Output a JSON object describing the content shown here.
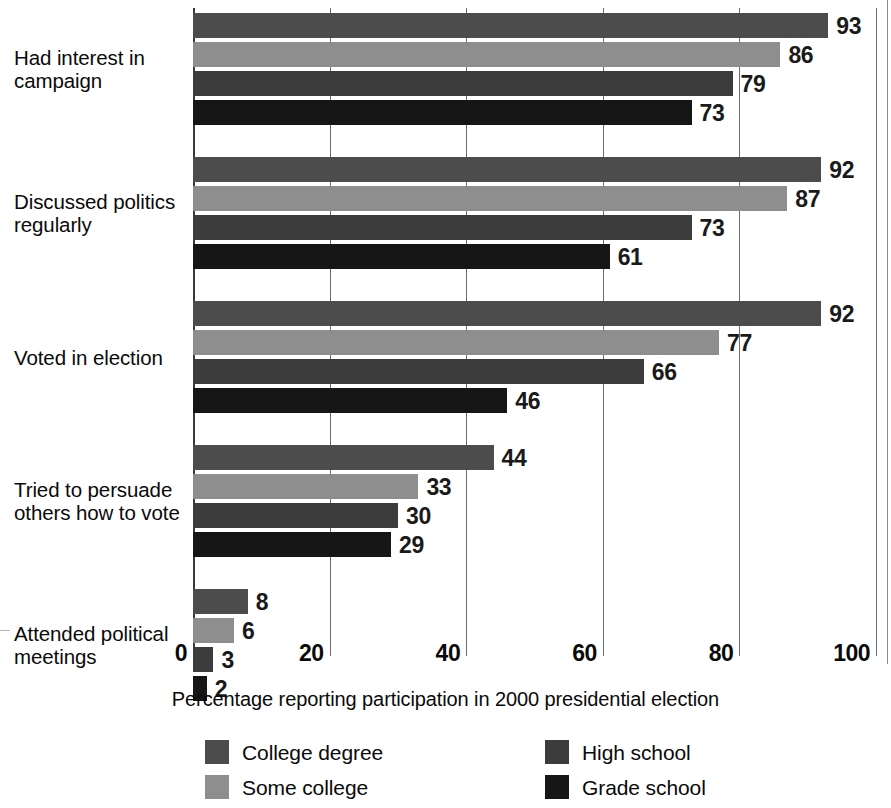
{
  "chart_data": {
    "type": "bar",
    "orientation": "horizontal",
    "title": "",
    "subtitle": "",
    "xlabel": "Percentage reporting participation in 2000 presidential election",
    "ylabel": "",
    "xlim": [
      0,
      100
    ],
    "xticks": [
      0,
      20,
      40,
      60,
      80,
      100
    ],
    "xtick_labels": [
      "0",
      "20",
      "40",
      "60",
      "80",
      "100"
    ],
    "grid": true,
    "grid_axis": "x",
    "legend_position": "bottom",
    "categories": [
      "Had interest in campaign",
      "Discussed politics regularly",
      "Voted in election",
      "Tried to persuade others how to vote",
      "Attended political meetings"
    ],
    "category_lines": [
      [
        "Had interest in",
        "campaign"
      ],
      [
        "Discussed politics",
        "regularly"
      ],
      [
        "Voted in election"
      ],
      [
        "Tried to persuade",
        "others how to vote"
      ],
      [
        "Attended political",
        "meetings"
      ]
    ],
    "series": [
      {
        "name": "College degree",
        "color": "#4c4c4c",
        "values": [
          93,
          92,
          92,
          44,
          8
        ]
      },
      {
        "name": "Some college",
        "color": "#8e8e8e",
        "values": [
          86,
          87,
          77,
          33,
          6
        ]
      },
      {
        "name": "High school",
        "color": "#3c3c3c",
        "values": [
          79,
          73,
          66,
          30,
          3
        ]
      },
      {
        "name": "Grade school",
        "color": "#161616",
        "values": [
          73,
          61,
          46,
          29,
          2
        ]
      }
    ]
  },
  "legend": {
    "items": [
      {
        "label": "College degree",
        "color": "#4c4c4c"
      },
      {
        "label": "Some college",
        "color": "#8e8e8e"
      },
      {
        "label": "High school",
        "color": "#3c3c3c"
      },
      {
        "label": "Grade school",
        "color": "#161616"
      }
    ]
  },
  "axis": {
    "x_title": "Percentage reporting participation in 2000 presidential election",
    "tick_0": "0",
    "tick_20": "20",
    "tick_40": "40",
    "tick_60": "60",
    "tick_80": "80",
    "tick_100": "100"
  }
}
